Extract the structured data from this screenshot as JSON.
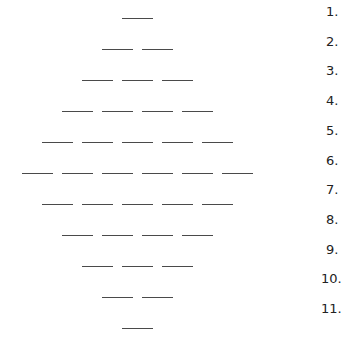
{
  "worksheet": {
    "rows": [
      {
        "number": "1.",
        "blanks": 1
      },
      {
        "number": "2.",
        "blanks": 2
      },
      {
        "number": "3.",
        "blanks": 3
      },
      {
        "number": "4.",
        "blanks": 4
      },
      {
        "number": "5.",
        "blanks": 5
      },
      {
        "number": "6.",
        "blanks": 6
      },
      {
        "number": "7.",
        "blanks": 5
      },
      {
        "number": "8.",
        "blanks": 4
      },
      {
        "number": "9.",
        "blanks": 3
      },
      {
        "number": "10.",
        "blanks": 2
      },
      {
        "number": "11.",
        "blanks": 1
      }
    ],
    "line_color": "#4a4a4a",
    "text_color": "#222222"
  }
}
